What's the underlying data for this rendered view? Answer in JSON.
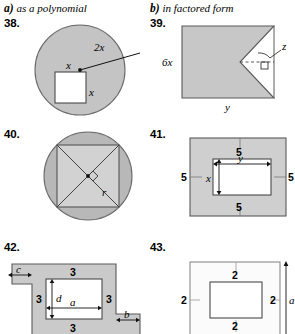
{
  "headers": [
    {
      "lead": "a)",
      "text": "as a polynomial"
    },
    {
      "lead": "b)",
      "text": "in factored form"
    }
  ],
  "colors": {
    "shade_dark": "#b5b5b5",
    "shade_mid": "#c9c9c9",
    "shade_light": "#d6d6d6",
    "shade_pale": "#fbfbfb",
    "stroke": "#555555",
    "text": "#000000"
  },
  "problems": [
    {
      "number": "38.",
      "type": "circle-with-square-hole",
      "labels": {
        "radius": "2x",
        "square_top": "x",
        "square_right": "x"
      }
    },
    {
      "number": "39.",
      "type": "rectangle-with-triangular-notch",
      "labels": {
        "height": "6x",
        "width": "y",
        "notch": "z"
      }
    },
    {
      "number": "40.",
      "type": "circle-with-inscribed-square",
      "labels": {
        "radius": "r"
      }
    },
    {
      "number": "41.",
      "type": "rectangular-border",
      "labels": {
        "border_top": "5",
        "border_bottom": "5",
        "border_left": "5",
        "border_right": "5",
        "inner_height": "x",
        "inner_width": "y"
      }
    },
    {
      "number": "42.",
      "type": "stepped-frame",
      "labels": {
        "top": "3",
        "bottom": "3",
        "left": "3",
        "right": "3",
        "inner_height": "d",
        "inner_width": "a",
        "offset_left": "c",
        "offset_right": "b"
      }
    },
    {
      "number": "43.",
      "type": "rectangular-border",
      "labels": {
        "border_top": "2",
        "border_bottom": "2",
        "border_left": "2",
        "border_right": "2",
        "overall_height": "a"
      }
    }
  ]
}
